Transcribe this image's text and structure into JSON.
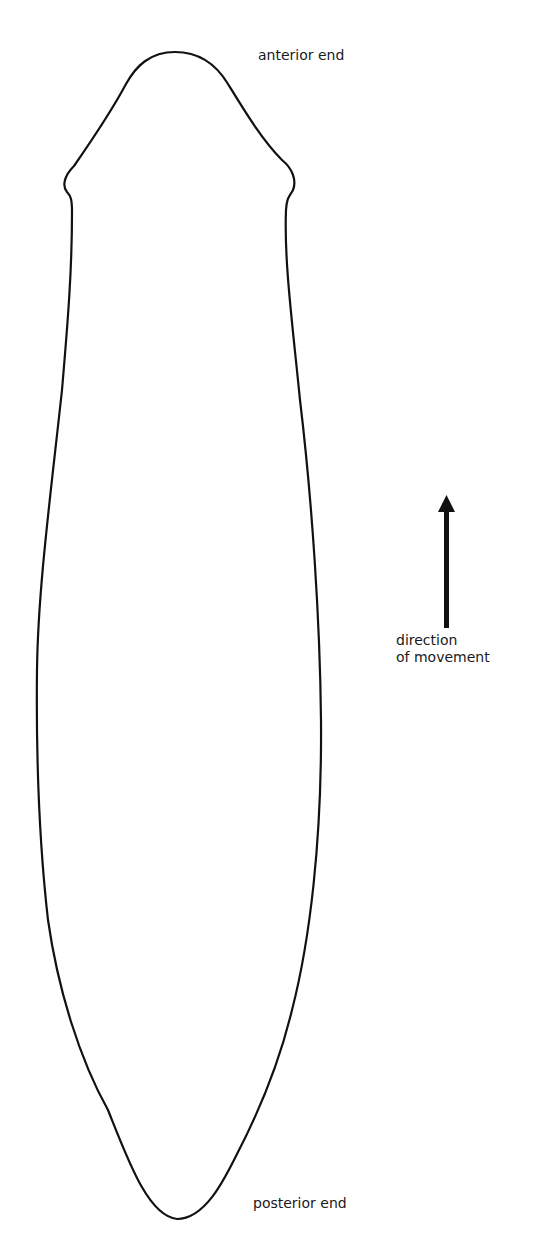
{
  "diagram": {
    "labels": {
      "anterior": "anterior end",
      "posterior": "posterior end",
      "direction_line1": "direction",
      "direction_line2": "of movement"
    },
    "arrow": {
      "direction": "up",
      "icon": "arrow-up-icon"
    },
    "colors": {
      "stroke": "#111111",
      "background": "#ffffff",
      "text": "#1a1a1a"
    }
  }
}
